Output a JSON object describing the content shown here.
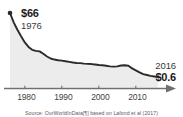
{
  "chart_data": {
    "type": "area",
    "title": "",
    "xlabel": "",
    "ylabel": "",
    "xlim": [
      1976,
      2016
    ],
    "ylim": [
      0,
      66
    ],
    "grid": false,
    "legend": null,
    "x_ticks": [
      "1980",
      "1990",
      "2000",
      "2010"
    ],
    "x_tick_values": [
      1980,
      1990,
      2000,
      2010
    ],
    "series": [
      {
        "name": "Price per watt",
        "unit": "$",
        "x": [
          1976,
          1977,
          1978,
          1979,
          1980,
          1981,
          1982,
          1983,
          1984,
          1985,
          1986,
          1987,
          1988,
          1989,
          1990,
          1991,
          1992,
          1993,
          1994,
          1995,
          1996,
          1997,
          1998,
          1999,
          2000,
          2001,
          2002,
          2003,
          2004,
          2005,
          2006,
          2007,
          2008,
          2009,
          2010,
          2011,
          2012,
          2013,
          2014,
          2015,
          2016
        ],
        "values": [
          66.0,
          48.0,
          36.0,
          27.0,
          20.0,
          15.5,
          13.0,
          12.2,
          11.8,
          10.0,
          8.2,
          7.0,
          6.4,
          6.0,
          5.8,
          5.5,
          5.2,
          4.9,
          4.7,
          4.6,
          4.4,
          4.3,
          4.2,
          4.0,
          3.8,
          3.7,
          3.5,
          3.3,
          3.2,
          3.3,
          3.6,
          3.7,
          3.5,
          2.6,
          2.0,
          1.5,
          1.1,
          0.95,
          0.8,
          0.7,
          0.6
        ]
      }
    ],
    "annotations": {
      "start": {
        "value": "$66",
        "year": "1976"
      },
      "end": {
        "year": "2016",
        "value": "$0.6"
      }
    },
    "colors": {
      "line": "#2b2b2b",
      "fill": "#ececec",
      "axis": "#6f6f6f",
      "text": "#2b2b2b"
    }
  },
  "caption": {
    "source": "Source: OurWorldInData[¶] based on Lafond et al (2017)"
  }
}
